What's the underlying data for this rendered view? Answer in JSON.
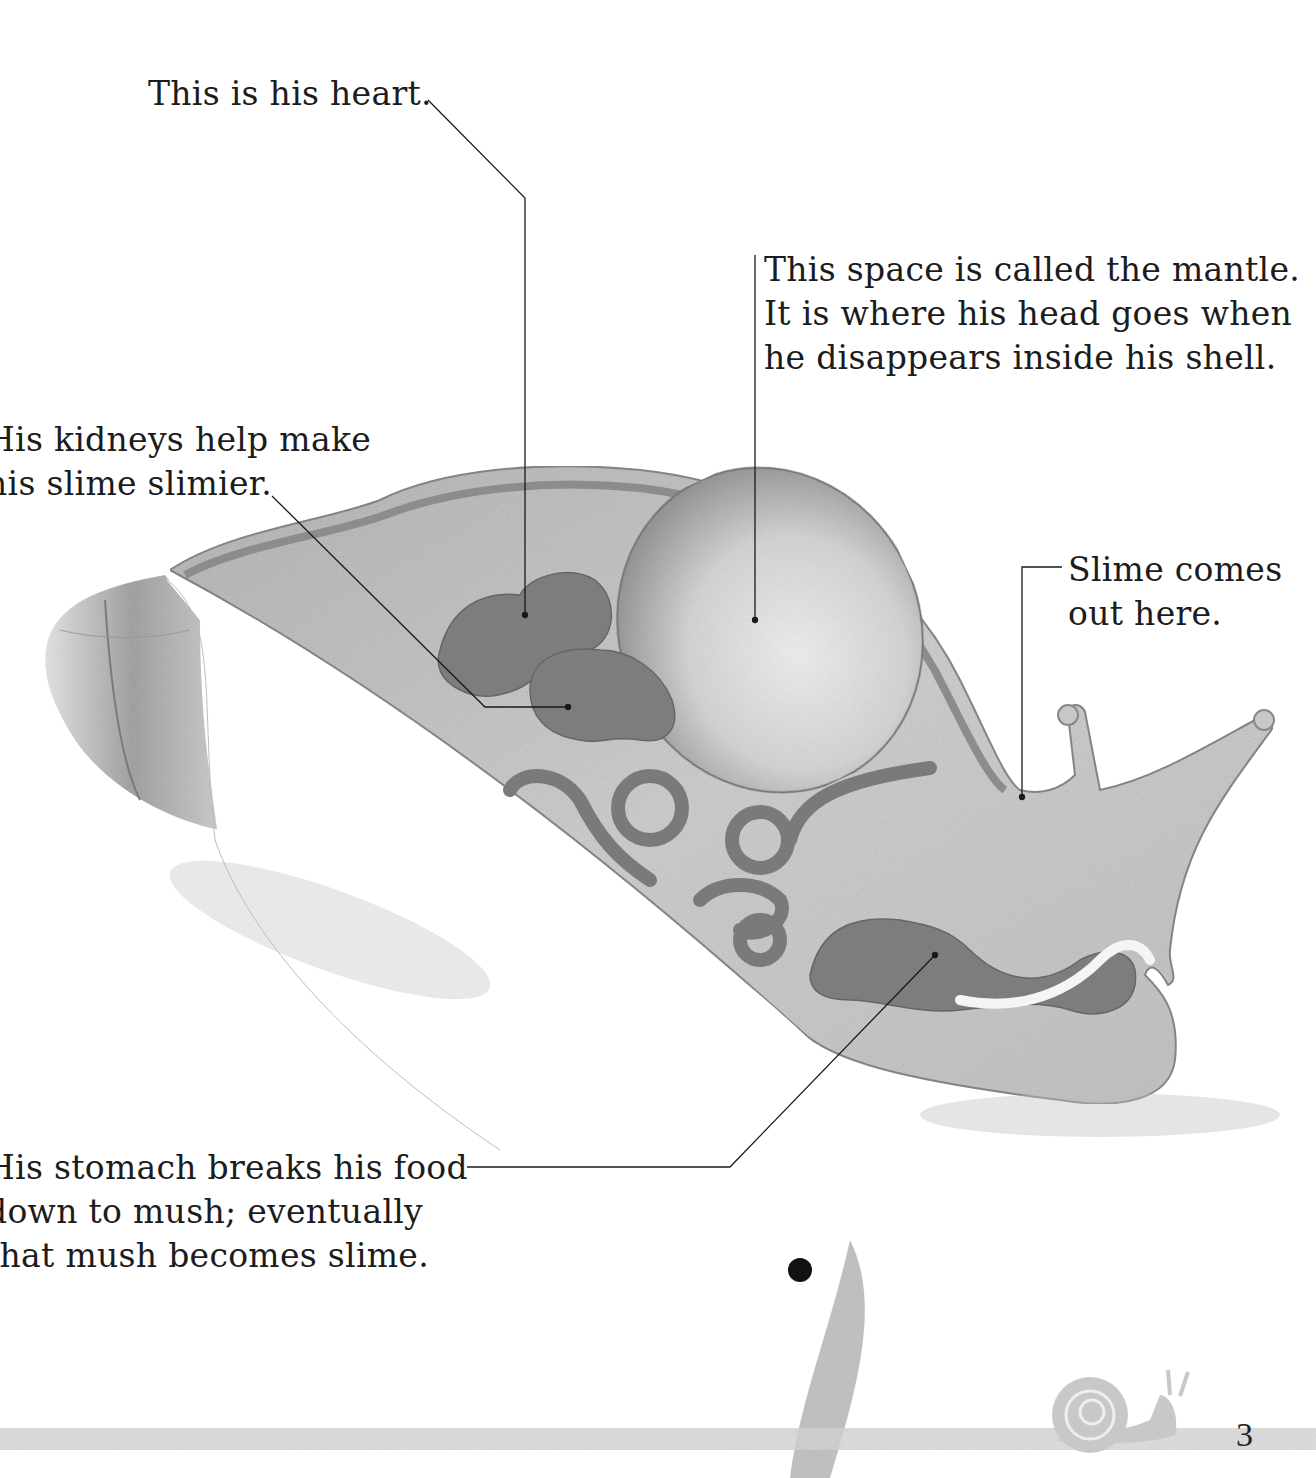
{
  "diagram": {
    "labels": {
      "heart": {
        "lines": [
          "This is his heart."
        ]
      },
      "mantle": {
        "lines": [
          "This space is called the mantle.",
          "It is where his head goes when",
          "he disappears inside his shell."
        ]
      },
      "kidneys": {
        "lines": [
          "His kidneys help make",
          "his slime slimier."
        ]
      },
      "slime_exit": {
        "lines": [
          "Slime comes",
          "out here."
        ]
      },
      "stomach": {
        "lines": [
          "His stomach breaks his food",
          "down to mush; eventually",
          "that mush becomes slime."
        ]
      }
    },
    "colors": {
      "body_fill": "#c8c8c8",
      "organ_fill": "#7a7a7a",
      "shell_edge": "#8c8c8c",
      "leader_line": "#1a1a1a",
      "text": "#1c1c1c",
      "footer_band": "#d4d4d4"
    }
  },
  "footer": {
    "page_number": "3",
    "icon": "snail-icon"
  }
}
